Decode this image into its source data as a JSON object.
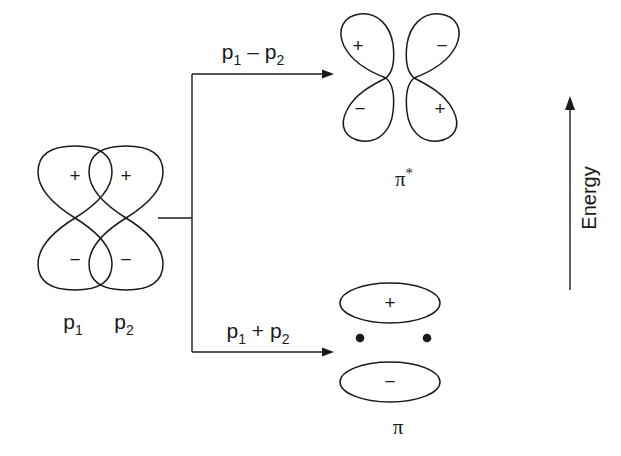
{
  "figure": {
    "background_color": "#ffffff",
    "line_color": "#1a1a1a"
  },
  "atomic_orbitals": [
    {
      "name": "p-orbital-1",
      "label_base": "p",
      "label_sub": "1",
      "lobes": [
        {
          "position": "top",
          "sign": "+"
        },
        {
          "position": "bottom",
          "sign": "−"
        }
      ]
    },
    {
      "name": "p-orbital-2",
      "label_base": "p",
      "label_sub": "2",
      "lobes": [
        {
          "position": "top",
          "sign": "+"
        },
        {
          "position": "bottom",
          "sign": "−"
        }
      ]
    }
  ],
  "combinations": {
    "antibonding": {
      "base_a": "p",
      "sub_a": "1",
      "operator": "–",
      "base_b": "p",
      "sub_b": "2"
    },
    "bonding": {
      "base_a": "p",
      "sub_a": "1",
      "operator": "+",
      "base_b": "p",
      "sub_b": "2"
    }
  },
  "molecular_orbitals": {
    "antibonding": {
      "name": "pi-star-antibonding-orbital",
      "symbol": "π",
      "superscript": "*",
      "lobes": [
        {
          "side": "left",
          "position": "top",
          "sign": "+"
        },
        {
          "side": "left",
          "position": "bottom",
          "sign": "−"
        },
        {
          "side": "right",
          "position": "top",
          "sign": "−"
        },
        {
          "side": "right",
          "position": "bottom",
          "sign": "+"
        }
      ],
      "electron_count": 0
    },
    "bonding": {
      "name": "pi-bonding-orbital",
      "symbol": "π",
      "superscript": "",
      "lobes": [
        {
          "position": "top",
          "sign": "+"
        },
        {
          "position": "bottom",
          "sign": "−"
        }
      ],
      "electron_count": 2
    }
  },
  "energy_axis": {
    "label": "Energy",
    "direction": "up"
  }
}
